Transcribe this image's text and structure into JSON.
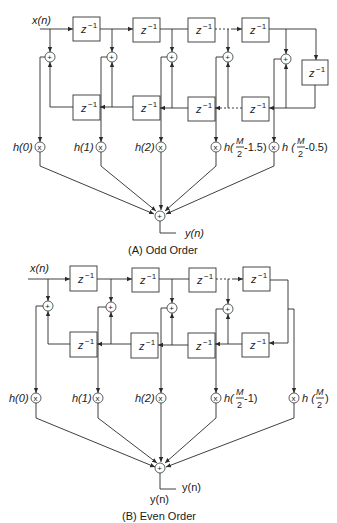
{
  "diagram": {
    "type": "FIR linear-phase folded structure",
    "delay_label": "z⁻¹",
    "panels": [
      {
        "id": "A",
        "caption": "(A) Odd Order",
        "input_label": "x(n)",
        "output_label": "y(n)",
        "coefficients": [
          "h(0)",
          "h(1)",
          "h(2)",
          "h(M/2−1.5)",
          "h(M/2−0.5)"
        ],
        "coef_text": {
          "c0": "h(0)",
          "c1": "h(1)",
          "c2": "h(2)",
          "c3_prefix": "h(",
          "c3_num": "M",
          "c3_den": "2",
          "c3_suffix": "-1.5)",
          "c4_prefix": "h (",
          "c4_num": "M",
          "c4_den": "2",
          "c4_suffix": "-0.5)"
        }
      },
      {
        "id": "B",
        "caption": "(B) Even Order",
        "input_label": "x(n)",
        "output_label": "y(n)",
        "output_label_2": "y(n)",
        "coefficients": [
          "h(0)",
          "h(1)",
          "h(2)",
          "h(M/2−1)",
          "h(M/2)"
        ],
        "coef_text": {
          "c0": "h(0)",
          "c1": "h(1)",
          "c2": "h(2)",
          "c3_prefix": "h(",
          "c3_num": "M",
          "c3_den": "2",
          "c3_suffix": "-1)",
          "c4_prefix": "h (",
          "c4_num": "M",
          "c4_den": "2",
          "c4_suffix": ")"
        }
      }
    ],
    "symbols": {
      "adder": "+",
      "multiplier": "x",
      "z": "z",
      "exp": "−1"
    }
  }
}
